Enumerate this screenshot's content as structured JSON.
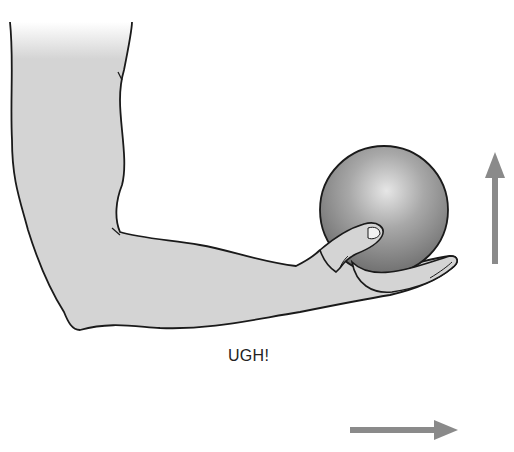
{
  "diagram": {
    "caption": "UGH!",
    "elements": [
      {
        "name": "arm",
        "description": "Bent arm with upper arm vertical and forearm horizontal, palm up"
      },
      {
        "name": "ball",
        "description": "Heavy gray sphere held in hand"
      },
      {
        "name": "up-arrow",
        "description": "Vertical arrow pointing up, right of ball"
      },
      {
        "name": "right-arrow",
        "description": "Horizontal arrow pointing right, bottom"
      }
    ],
    "colors": {
      "skin_fill": "#d4d4d4",
      "outline": "#1a1a1a",
      "ball_light": "#e0e0e0",
      "ball_dark": "#7a7a7a",
      "arrow": "#8a8a8a",
      "text": "#222222"
    }
  }
}
